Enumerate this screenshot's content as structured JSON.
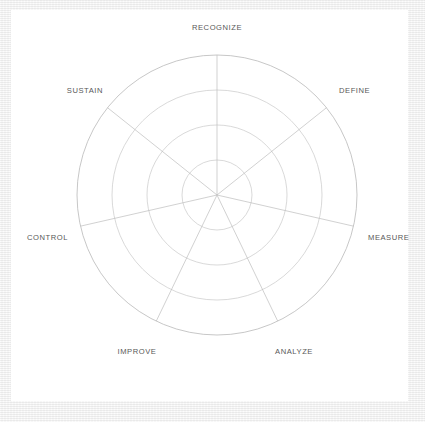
{
  "page": {
    "background_color": "#f1f1f1",
    "panel_color": "#ffffff"
  },
  "chart_data": {
    "type": "radar",
    "title": "",
    "subtitle": "",
    "xlabel": "",
    "ylabel": "",
    "legend_position": "none",
    "grid": true,
    "grid_rings": 4,
    "ring_radii_px": [
      35,
      70,
      105,
      140
    ],
    "center_px": {
      "x": 217,
      "y": 195
    },
    "outer_radius_px": 140,
    "rmin": 0,
    "rmax": 4,
    "categories": [
      "RECOGNIZE",
      "DEFINE",
      "MEASURE",
      "ANALYZE",
      "IMPROVE",
      "CONTROL",
      "SUSTAIN"
    ],
    "axis_angles_deg": [
      90,
      38.571,
      -12.857,
      -64.286,
      -115.714,
      -167.143,
      141.429
    ],
    "series": [
      {
        "name": "",
        "values": [
          null,
          null,
          null,
          null,
          null,
          null,
          null
        ]
      }
    ],
    "annotations": [],
    "colors": {
      "grid_line": "#c9c9c9",
      "outer_ring": "#b9b9b9",
      "spoke": "#bdbdbd",
      "label_text": "#585858"
    }
  },
  "labels": {
    "recognize": "RECOGNIZE",
    "define": "DEFINE",
    "measure": "MEASURE",
    "analyze": "ANALYZE",
    "improve": "IMPROVE",
    "control": "CONTROL",
    "sustain": "SUSTAIN"
  }
}
